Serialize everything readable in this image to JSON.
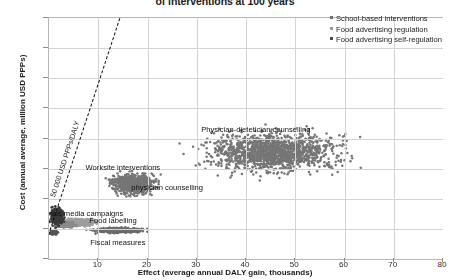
{
  "chart_data": {
    "type": "scatter",
    "title": "of interventions at 100 years",
    "xlabel": "Effect (average annual DALY gain, thousands)",
    "ylabel": "Cost (annual average, million USD PPPs)",
    "xlim": [
      0,
      80
    ],
    "ylim": [
      -100,
      700
    ],
    "xticks": [
      0,
      10,
      20,
      30,
      40,
      50,
      60,
      70,
      80
    ],
    "yticks": [
      -100,
      0,
      100,
      200,
      300,
      400,
      500,
      600,
      700
    ],
    "grid": true,
    "legend_position": "top-right",
    "legend": [
      {
        "marker": "*",
        "label": "School-based interventions",
        "color": "#6e6e6e"
      },
      {
        "marker": "ˈ",
        "label": "Food advertising regulation",
        "color": "#9a9a9a"
      },
      {
        "marker": "‡",
        "label": "Food advertising self-regulation",
        "color": "#4a4a4a"
      }
    ],
    "threshold": {
      "label": "50 000 USD PPPs/DALY",
      "slope_usd_per_daly": 50000,
      "x0": 0,
      "y0": -20,
      "x1": 14.5,
      "y1": 700
    },
    "annotations": [
      {
        "text": "Physician-dietetician counselling",
        "x": 42,
        "y": 330
      },
      {
        "text": "Worksite interventions",
        "x": 15,
        "y": 205
      },
      {
        "text": "physician counselling",
        "x": 24,
        "y": 140
      },
      {
        "text": "mass media campaigns",
        "x": 7,
        "y": 52
      },
      {
        "text": "Food labelling",
        "x": 13,
        "y": 28
      },
      {
        "text": "Fiscal measures",
        "x": 14,
        "y": -45
      }
    ],
    "series": [
      {
        "name": "Physician-dietetician counselling",
        "color": "#767676",
        "center_x": 45.5,
        "center_y": 255,
        "spread_x": 10.5,
        "spread_y": 52,
        "n_points": 1500,
        "x_range": [
          26,
          70
        ],
        "y_range": [
          130,
          370
        ]
      },
      {
        "name": "physician counselling",
        "color": "#767676",
        "center_x": 17.0,
        "center_y": 150,
        "spread_x": 3.6,
        "spread_y": 26,
        "n_points": 700,
        "x_range": [
          8,
          27
        ],
        "y_range": [
          70,
          230
        ]
      },
      {
        "name": "mass media campaigns",
        "color": "#9e9e9e",
        "center_x": 6.0,
        "center_y": 22,
        "spread_x": 2.6,
        "spread_y": 9,
        "n_points": 420,
        "x_range": [
          0,
          14
        ],
        "y_range": [
          0,
          52
        ]
      },
      {
        "name": "Food labelling",
        "color": "#8b8b8b",
        "center_x": 3.2,
        "center_y": 14,
        "spread_x": 1.6,
        "spread_y": 7,
        "n_points": 260,
        "x_range": [
          0,
          8
        ],
        "y_range": [
          -5,
          36
        ]
      },
      {
        "name": "Fiscal measures",
        "color": "#6b6b6b",
        "center_x": 14.0,
        "center_y": -5,
        "spread_x": 3.4,
        "spread_y": 6,
        "n_points": 620,
        "x_range": [
          6,
          22
        ],
        "y_range": [
          -22,
          12
        ]
      },
      {
        "name": "School-based interventions",
        "color": "#3a3a3a",
        "center_x": 1.6,
        "center_y": 40,
        "spread_x": 1.1,
        "spread_y": 22,
        "n_points": 300,
        "x_range": [
          0,
          4
        ],
        "y_range": [
          -8,
          95
        ]
      },
      {
        "name": "Food advertising self-regulation",
        "color": "#555555",
        "center_x": 1.0,
        "center_y": -12,
        "spread_x": 0.6,
        "spread_y": 5,
        "n_points": 90,
        "x_range": [
          0,
          2.5
        ],
        "y_range": [
          -25,
          4
        ]
      }
    ]
  }
}
